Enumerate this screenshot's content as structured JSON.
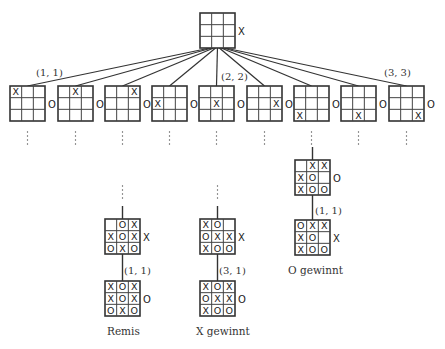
{
  "diagram": {
    "root": {
      "board": [
        "",
        "",
        "",
        "",
        "",
        "",
        "",
        "",
        ""
      ],
      "to_move": "X"
    },
    "level1": [
      {
        "board": [
          "X",
          "",
          "",
          "",
          "",
          "",
          "",
          "",
          ""
        ],
        "to_move": "O",
        "edge_label": "(1, 1)"
      },
      {
        "board": [
          "",
          "X",
          "",
          "",
          "",
          "",
          "",
          "",
          ""
        ],
        "to_move": "O",
        "edge_label": ""
      },
      {
        "board": [
          "",
          "",
          "X",
          "",
          "",
          "",
          "",
          "",
          ""
        ],
        "to_move": "O",
        "edge_label": ""
      },
      {
        "board": [
          "",
          "",
          "",
          "X",
          "",
          "",
          "",
          "",
          ""
        ],
        "to_move": "O",
        "edge_label": ""
      },
      {
        "board": [
          "",
          "",
          "",
          "",
          "X",
          "",
          "",
          "",
          ""
        ],
        "to_move": "O",
        "edge_label": "(2, 2)"
      },
      {
        "board": [
          "",
          "",
          "",
          "",
          "",
          "X",
          "",
          "",
          ""
        ],
        "to_move": "O",
        "edge_label": ""
      },
      {
        "board": [
          "",
          "",
          "",
          "",
          "",
          "",
          "X",
          "",
          ""
        ],
        "to_move": "O",
        "edge_label": ""
      },
      {
        "board": [
          "",
          "",
          "",
          "",
          "",
          "",
          "",
          "X",
          ""
        ],
        "to_move": "O",
        "edge_label": ""
      },
      {
        "board": [
          "",
          "",
          "",
          "",
          "",
          "",
          "",
          "",
          "X"
        ],
        "to_move": "O",
        "edge_label": "(3, 3)"
      }
    ],
    "ellipsis": "⋮",
    "branches": [
      {
        "name": "remis",
        "before": {
          "board": [
            "",
            "O",
            "X",
            "X",
            "O",
            "X",
            "O",
            "X",
            "O"
          ],
          "to_move": "X"
        },
        "move_label": "(1, 1)",
        "after": {
          "board": [
            "X",
            "O",
            "X",
            "X",
            "O",
            "X",
            "O",
            "X",
            "O"
          ],
          "to_move": "O"
        },
        "result": "Remis"
      },
      {
        "name": "x-wins",
        "before": {
          "board": [
            "X",
            "O",
            "",
            "O",
            "X",
            "X",
            "X",
            "O",
            "O"
          ],
          "to_move": "X"
        },
        "move_label": "(3, 1)",
        "after": {
          "board": [
            "X",
            "O",
            "X",
            "O",
            "X",
            "X",
            "X",
            "O",
            "O"
          ],
          "to_move": "O"
        },
        "result": "X gewinnt"
      },
      {
        "name": "o-wins",
        "before": {
          "board": [
            "",
            "X",
            "X",
            "X",
            "O",
            "",
            "X",
            "O",
            "O"
          ],
          "to_move": "O"
        },
        "move_label": "(1, 1)",
        "after": {
          "board": [
            "O",
            "X",
            "X",
            "X",
            "O",
            "",
            "X",
            "O",
            "O"
          ],
          "to_move": "X"
        },
        "result": "O gewinnt"
      }
    ]
  }
}
